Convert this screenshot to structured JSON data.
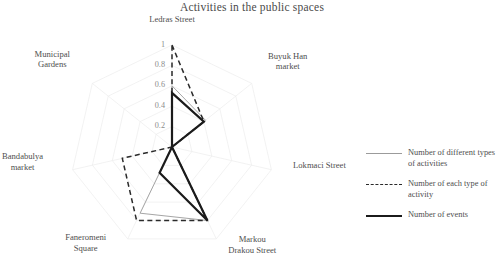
{
  "chart_data": {
    "type": "radar",
    "title": "Activities in the public spaces",
    "categories": [
      "Ledras Street",
      "Buyuk Han market",
      "Lokmaci Street",
      "Markou Drakou Street",
      "Faneromeni Square",
      "Bandabulya market",
      "Municipal Gardens"
    ],
    "category_lines": [
      [
        "Ledras Street"
      ],
      [
        "Buyuk Han",
        "market"
      ],
      [
        "Lokmaci Street"
      ],
      [
        "Markou",
        "Drakou Street"
      ],
      [
        "Faneromeni",
        "Square"
      ],
      [
        "Bandabulya",
        "market"
      ],
      [
        "Municipal",
        "Gardens"
      ]
    ],
    "rtick_labels": [
      "1",
      "0.8",
      "0.6",
      "0.4",
      "0.2"
    ],
    "rticks": [
      1,
      0.8,
      0.6,
      0.4,
      0.2
    ],
    "rlim": [
      0,
      1
    ],
    "grid": true,
    "legend_position": "right",
    "series": [
      {
        "name": "Number of different types of activities",
        "style": "thin-solid-gray",
        "color": "#9b9b9b",
        "values": [
          0.6,
          0.42,
          0.0,
          0.8,
          0.72,
          0.0,
          0.0
        ]
      },
      {
        "name": "Number of each type of activity",
        "style": "dashed-black",
        "color": "#2a2a2a",
        "values": [
          1.0,
          0.4,
          0.0,
          0.8,
          0.8,
          0.5,
          0.0
        ]
      },
      {
        "name": "Number of events",
        "style": "thick-solid-black",
        "color": "#1b1b1b",
        "values": [
          0.53,
          0.4,
          0.0,
          0.8,
          0.28,
          0.0,
          0.0
        ]
      }
    ]
  },
  "legend": {
    "items": [
      {
        "label_lines": [
          "Number of different",
          "types of  activities"
        ],
        "swatch": "thin-line-swatch"
      },
      {
        "label_lines": [
          "Number of each type of",
          "activity"
        ],
        "swatch": "dashed-line-swatch"
      },
      {
        "label_lines": [
          "Number of events"
        ],
        "swatch": "thick-line-swatch"
      }
    ]
  }
}
